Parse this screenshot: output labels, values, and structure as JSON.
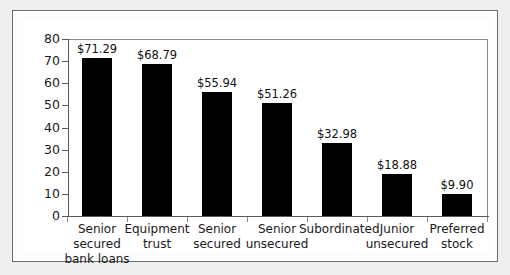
{
  "chart_data": {
    "type": "bar",
    "title": "",
    "xlabel": "",
    "ylabel": "",
    "ylim": [
      0,
      80
    ],
    "ytick_step": 10,
    "ytick_labels": [
      "80",
      "70",
      "60",
      "50",
      "40",
      "30",
      "20",
      "10",
      "0"
    ],
    "grid": false,
    "legend": null,
    "bar_color": "#000000",
    "plot_background": "#ffffff",
    "page_background": "#efefef",
    "frame_color": "#6e6e6e",
    "categories": [
      "Senior secured bank loans",
      "Equipment trust",
      "Senior secured",
      "Senior unsecured",
      "Subordinated",
      "Junior unsecured",
      "Preferred stock"
    ],
    "category_label_lines": [
      [
        "Senior",
        "secured",
        "bank loans"
      ],
      [
        "Equipment",
        "trust"
      ],
      [
        "Senior",
        "secured"
      ],
      [
        "Senior",
        "unsecured"
      ],
      [
        "Subordinated"
      ],
      [
        "Junior",
        "unsecured"
      ],
      [
        "Preferred",
        "stock"
      ]
    ],
    "values": [
      71.29,
      68.79,
      55.94,
      51.26,
      32.98,
      18.88,
      9.9
    ],
    "value_labels": [
      "$71.29",
      "$68.79",
      "$55.94",
      "$51.26",
      "$32.98",
      "$18.88",
      "$9.90"
    ]
  }
}
